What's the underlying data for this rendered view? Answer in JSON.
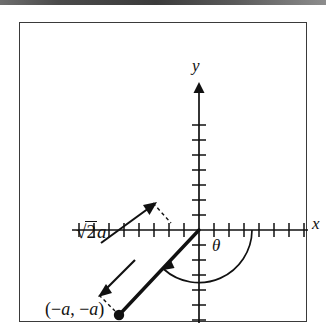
{
  "figure": {
    "kind": "coordinate-plane-diagram",
    "background_color": "#ffffff",
    "frame_color": "#3a3a3a",
    "ink_color": "#111111"
  },
  "axes": {
    "x_label": "x",
    "y_label": "y",
    "origin_px": [
      160,
      185
    ],
    "tick_spacing_px": 15,
    "x_ticks_positive": 8,
    "x_ticks_negative": 8,
    "y_ticks_positive": 7,
    "y_ticks_negative": 7,
    "x_axis_start_px": 33,
    "x_axis_end_px": 301,
    "y_axis_top_px": 40,
    "y_axis_bottom_px": 314
  },
  "annotations": {
    "angle_label": "θ",
    "length_label": {
      "radical": "√",
      "radicand": "2",
      "coefficient": "a",
      "full_text": "√2a"
    },
    "point_label": "(−a, −a)",
    "point_label_parts": {
      "open": "(",
      "minus": "−",
      "var1": "a",
      "comma": ", ",
      "var2": "a",
      "close": ")"
    },
    "point_px": [
      80,
      270
    ],
    "segment_from_px": [
      160,
      185
    ],
    "segment_to_px": [
      80,
      270
    ]
  },
  "icons": {
    "x_axis_arrow": "arrow-right-icon",
    "y_axis_arrow": "arrow-up-icon",
    "measure_arrow_upper": "arrow-up-right-icon",
    "measure_arrow_lower": "arrow-down-left-icon",
    "angle_arc": "arc-icon",
    "endpoint_dot": "point-dot-icon"
  }
}
